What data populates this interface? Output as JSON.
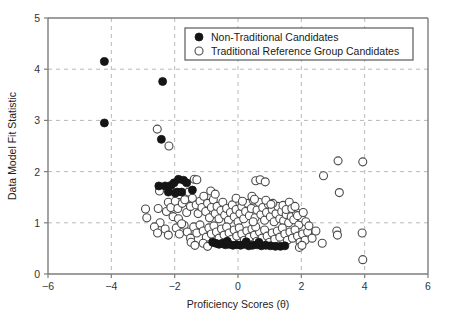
{
  "chart_data": {
    "type": "scatter",
    "title": "",
    "xlabel": "Proficiency Scores (θ)",
    "ylabel": "Data Model Fit Statistic",
    "xlim": [
      -6,
      6
    ],
    "ylim": [
      0,
      5
    ],
    "xticks": [
      -6,
      -4,
      -2,
      0,
      2,
      4,
      6
    ],
    "xticklabels": [
      "−6",
      "−4",
      "−2",
      "0",
      "2",
      "4",
      "6"
    ],
    "yticks": [
      0,
      1,
      2,
      3,
      4,
      5
    ],
    "yticklabels": [
      "0",
      "1",
      "2",
      "3",
      "4",
      "5"
    ],
    "grid": true,
    "grid_style": "dashed",
    "legend_position": "top-right",
    "marker_colors": {
      "filled": "#151515",
      "open_stroke": "#4a4a4a",
      "open_fill": "#ffffff",
      "grid": "#b9b9b9",
      "axis": "#7d7d7d"
    },
    "series": [
      {
        "name": "Non-Traditional Candidates",
        "marker": "filled-circle",
        "points": [
          [
            -4.22,
            4.15
          ],
          [
            -4.22,
            2.95
          ],
          [
            -2.38,
            3.76
          ],
          [
            -2.42,
            2.63
          ],
          [
            -2.5,
            1.72
          ],
          [
            -2.3,
            1.72
          ],
          [
            -2.12,
            1.73
          ],
          [
            -2.02,
            1.78
          ],
          [
            -1.92,
            1.6
          ],
          [
            -1.88,
            1.85
          ],
          [
            -1.72,
            1.83
          ],
          [
            -1.78,
            1.6
          ],
          [
            -1.62,
            1.78
          ],
          [
            -1.44,
            1.64
          ],
          [
            -1.98,
            1.58
          ],
          [
            -2.2,
            1.6
          ],
          [
            -0.8,
            0.62
          ],
          [
            -0.7,
            0.6
          ],
          [
            -0.6,
            0.58
          ],
          [
            -0.5,
            0.6
          ],
          [
            -0.4,
            0.57
          ],
          [
            -0.28,
            0.58
          ],
          [
            -0.16,
            0.56
          ],
          [
            -0.04,
            0.57
          ],
          [
            0.08,
            0.56
          ],
          [
            0.2,
            0.58
          ],
          [
            0.34,
            0.55
          ],
          [
            0.46,
            0.56
          ],
          [
            0.6,
            0.57
          ],
          [
            0.74,
            0.55
          ],
          [
            0.88,
            0.56
          ],
          [
            1.02,
            0.55
          ],
          [
            1.18,
            0.54
          ],
          [
            1.34,
            0.54
          ],
          [
            1.48,
            0.55
          ],
          [
            0.26,
            0.63
          ],
          [
            -0.34,
            0.64
          ],
          [
            0.66,
            0.62
          ]
        ]
      },
      {
        "name": "Traditional Reference Group Candidates",
        "marker": "open-circle",
        "points": [
          [
            -2.55,
            2.83
          ],
          [
            -2.18,
            2.5
          ],
          [
            -2.92,
            1.27
          ],
          [
            -2.88,
            1.1
          ],
          [
            -2.48,
            1.62
          ],
          [
            -2.52,
            1.28
          ],
          [
            -2.46,
            1.0
          ],
          [
            -2.26,
            1.22
          ],
          [
            -2.2,
            1.4
          ],
          [
            -2.12,
            1.3
          ],
          [
            -2.05,
            1.12
          ],
          [
            -1.98,
            1.42
          ],
          [
            -1.9,
            1.28
          ],
          [
            -1.85,
            1.55
          ],
          [
            -1.76,
            1.38
          ],
          [
            -1.68,
            1.45
          ],
          [
            -1.62,
            1.2
          ],
          [
            -1.56,
            1.6
          ],
          [
            -1.5,
            1.32
          ],
          [
            -1.44,
            1.48
          ],
          [
            -1.38,
            1.85
          ],
          [
            -1.3,
            1.84
          ],
          [
            -1.32,
            1.35
          ],
          [
            -1.26,
            1.18
          ],
          [
            -1.2,
            1.42
          ],
          [
            -1.14,
            1.3
          ],
          [
            -1.08,
            1.52
          ],
          [
            -1.02,
            1.22
          ],
          [
            -0.96,
            1.38
          ],
          [
            -0.9,
            1.1
          ],
          [
            -0.84,
            1.3
          ],
          [
            -0.78,
            1.45
          ],
          [
            -0.72,
            1.18
          ],
          [
            -0.66,
            1.32
          ],
          [
            -0.6,
            1.08
          ],
          [
            -0.54,
            1.24
          ],
          [
            -0.48,
            1.4
          ],
          [
            -0.42,
            1.15
          ],
          [
            -0.36,
            1.28
          ],
          [
            -0.3,
            1.05
          ],
          [
            -0.24,
            1.2
          ],
          [
            -0.18,
            1.35
          ],
          [
            -0.12,
            1.12
          ],
          [
            -0.06,
            1.26
          ],
          [
            0.0,
            1.02
          ],
          [
            0.06,
            1.18
          ],
          [
            0.12,
            1.32
          ],
          [
            0.18,
            1.08
          ],
          [
            0.24,
            1.22
          ],
          [
            0.3,
            1.38
          ],
          [
            0.36,
            1.14
          ],
          [
            0.42,
            1.28
          ],
          [
            0.48,
            1.44
          ],
          [
            0.54,
            1.1
          ],
          [
            0.6,
            1.25
          ],
          [
            0.66,
            1.4
          ],
          [
            0.72,
            1.16
          ],
          [
            0.78,
            1.3
          ],
          [
            0.84,
            1.05
          ],
          [
            0.9,
            1.2
          ],
          [
            0.96,
            1.36
          ],
          [
            1.02,
            1.12
          ],
          [
            1.08,
            1.26
          ],
          [
            1.14,
            1.02
          ],
          [
            1.2,
            1.18
          ],
          [
            1.26,
            1.32
          ],
          [
            1.32,
            1.08
          ],
          [
            1.38,
            1.22
          ],
          [
            1.44,
            1.04
          ],
          [
            1.52,
            1.16
          ],
          [
            1.6,
            1.0
          ],
          [
            1.68,
            1.12
          ],
          [
            1.76,
            1.06
          ],
          [
            1.84,
            1.2
          ],
          [
            1.92,
            0.96
          ],
          [
            2.0,
            1.1
          ],
          [
            -2.3,
            0.88
          ],
          [
            -2.2,
            0.76
          ],
          [
            -1.95,
            0.9
          ],
          [
            -1.85,
            0.78
          ],
          [
            -1.7,
            0.95
          ],
          [
            -1.6,
            0.82
          ],
          [
            -1.5,
            0.7
          ],
          [
            -1.4,
            0.92
          ],
          [
            -1.3,
            0.8
          ],
          [
            -1.2,
            0.96
          ],
          [
            -1.1,
            0.84
          ],
          [
            -1.0,
            0.72
          ],
          [
            -0.92,
            0.9
          ],
          [
            -0.84,
            0.78
          ],
          [
            -0.76,
            0.94
          ],
          [
            -0.68,
            0.82
          ],
          [
            -0.6,
            0.7
          ],
          [
            -0.52,
            0.88
          ],
          [
            -0.44,
            0.76
          ],
          [
            -0.36,
            0.92
          ],
          [
            -0.28,
            0.8
          ],
          [
            -0.2,
            0.68
          ],
          [
            -0.12,
            0.86
          ],
          [
            -0.04,
            0.74
          ],
          [
            0.04,
            0.9
          ],
          [
            0.12,
            0.78
          ],
          [
            0.2,
            0.66
          ],
          [
            0.28,
            0.84
          ],
          [
            0.36,
            0.72
          ],
          [
            0.44,
            0.88
          ],
          [
            0.52,
            0.76
          ],
          [
            0.6,
            0.64
          ],
          [
            0.68,
            0.82
          ],
          [
            0.76,
            0.7
          ],
          [
            0.84,
            0.86
          ],
          [
            0.92,
            0.74
          ],
          [
            1.0,
            0.62
          ],
          [
            1.08,
            0.8
          ],
          [
            1.16,
            0.68
          ],
          [
            1.24,
            0.84
          ],
          [
            1.32,
            0.72
          ],
          [
            1.4,
            0.9
          ],
          [
            1.48,
            0.78
          ],
          [
            1.56,
            0.66
          ],
          [
            1.64,
            0.82
          ],
          [
            1.72,
            0.7
          ],
          [
            1.8,
            0.86
          ],
          [
            1.88,
            0.74
          ],
          [
            1.96,
            0.62
          ],
          [
            2.04,
            0.78
          ],
          [
            2.12,
            0.66
          ],
          [
            2.2,
            0.82
          ],
          [
            -1.48,
            0.62
          ],
          [
            -1.36,
            0.56
          ],
          [
            -1.1,
            0.6
          ],
          [
            -0.96,
            0.54
          ],
          [
            0.56,
            0.92
          ],
          [
            0.48,
            1.02
          ],
          [
            1.1,
            1.38
          ],
          [
            0.88,
            1.44
          ],
          [
            0.44,
            1.52
          ],
          [
            0.52,
            1.46
          ],
          [
            -0.06,
            1.48
          ],
          [
            0.14,
            1.42
          ],
          [
            1.42,
            1.34
          ],
          [
            1.52,
            1.26
          ],
          [
            1.62,
            1.4
          ],
          [
            1.7,
            1.28
          ],
          [
            1.8,
            1.32
          ],
          [
            1.88,
            1.14
          ],
          [
            2.06,
            1.2
          ],
          [
            2.14,
            1.02
          ],
          [
            2.24,
            0.94
          ],
          [
            2.34,
            0.7
          ],
          [
            2.46,
            0.84
          ],
          [
            2.66,
            0.6
          ],
          [
            0.56,
            1.82
          ],
          [
            0.7,
            1.84
          ],
          [
            0.86,
            1.8
          ],
          [
            1.04,
            1.36
          ],
          [
            2.7,
            1.92
          ],
          [
            3.16,
            2.21
          ],
          [
            3.2,
            1.59
          ],
          [
            3.12,
            0.84
          ],
          [
            3.14,
            0.76
          ],
          [
            3.94,
            2.19
          ],
          [
            3.92,
            0.8
          ],
          [
            3.94,
            0.28
          ],
          [
            -2.64,
            0.92
          ],
          [
            -2.54,
            0.8
          ],
          [
            -1.88,
            1.08
          ],
          [
            -1.78,
            0.98
          ],
          [
            -0.86,
            1.62
          ],
          [
            -0.72,
            1.56
          ],
          [
            1.94,
            0.52
          ],
          [
            2.02,
            0.56
          ]
        ]
      }
    ]
  },
  "legend": {
    "entries": [
      {
        "label": "Non-Traditional Candidates",
        "marker": "filled-circle"
      },
      {
        "label": "Traditional Reference Group Candidates",
        "marker": "open-circle"
      }
    ]
  }
}
